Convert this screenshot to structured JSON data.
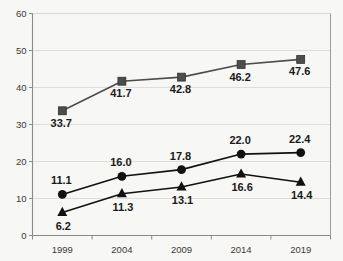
{
  "chart_data": {
    "type": "line",
    "title": "",
    "xlabel": "",
    "ylabel": "",
    "categories": [
      "1999",
      "2004",
      "2009",
      "2014",
      "2019"
    ],
    "x": [
      1999,
      2004,
      2009,
      2014,
      2019
    ],
    "ylim": [
      0,
      60
    ],
    "yticks": [
      0,
      10,
      20,
      30,
      40,
      50,
      60
    ],
    "ytick_labels": [
      "0",
      "10",
      "20",
      "30",
      "40",
      "50",
      "60"
    ],
    "grid": true,
    "grid_axis": "y",
    "legend": "none",
    "series": [
      {
        "name": "series-square",
        "marker": "square",
        "color": "#4d4d4d",
        "values": [
          33.7,
          41.7,
          42.8,
          46.2,
          47.6
        ],
        "labels": [
          "33.7",
          "41.7",
          "42.8",
          "46.2",
          "47.6"
        ],
        "label_position": "below-left"
      },
      {
        "name": "series-circle",
        "marker": "circle",
        "color": "#111111",
        "values": [
          11.1,
          16.0,
          17.8,
          22.0,
          22.4
        ],
        "labels": [
          "11.1",
          "16.0",
          "17.8",
          "22.0",
          "22.4"
        ],
        "label_position": "above-left"
      },
      {
        "name": "series-triangle",
        "marker": "triangle",
        "color": "#111111",
        "values": [
          6.2,
          11.3,
          13.1,
          16.6,
          14.4
        ],
        "labels": [
          "6.2",
          "11.3",
          "13.1",
          "16.6",
          "14.4"
        ],
        "label_position": "below"
      }
    ],
    "colors": {
      "background": "#f7f7f5",
      "grid": "#d5d5d5",
      "axis": "#8a8a8a",
      "text": "#3a3a3a",
      "label_text": "#1a1a1a",
      "square_series": "#4d4d4d",
      "circle_series": "#111111",
      "triangle_series": "#111111"
    }
  }
}
